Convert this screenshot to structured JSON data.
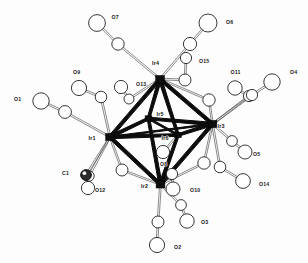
{
  "figure": {
    "kind": "ortep-crystal-structure",
    "background_color": "#fdfdfd",
    "line_color": "#1a1a1a",
    "metal_fill": "#0d0d0d",
    "carbonyl_fill": "#ffffff",
    "shaded_atom_fill": "#2b2b2b"
  },
  "metal_atoms": [
    {
      "label": "Ir1",
      "cx": 110.0,
      "cy": 137.0,
      "label_x": 88.5,
      "label_y": 140.0,
      "r": 4.4
    },
    {
      "label": "Ir2",
      "cx": 160.5,
      "cy": 184.5,
      "label_x": 141.0,
      "label_y": 187.5,
      "r": 4.4
    },
    {
      "label": "Ir3",
      "cx": 212.5,
      "cy": 124.0,
      "label_x": 217.5,
      "label_y": 127.5,
      "r": 4.4
    },
    {
      "label": "Ir4",
      "cx": 160.0,
      "cy": 79.0,
      "label_x": 152.0,
      "label_y": 64.5,
      "r": 4.4
    },
    {
      "label": "Ir5",
      "cx": 148.5,
      "cy": 118.5,
      "label_x": 156.5,
      "label_y": 116.0,
      "r": 3.4
    },
    {
      "label": "Ir6",
      "cx": 178.0,
      "cy": 135.0,
      "label_x": 161.5,
      "label_y": 140.0,
      "r": 3.4
    }
  ],
  "metal_metal_bonds": [
    {
      "from": "Ir4",
      "to": "Ir1",
      "weight": "heavy"
    },
    {
      "from": "Ir4",
      "to": "Ir3",
      "weight": "heavy"
    },
    {
      "from": "Ir4",
      "to": "Ir5",
      "weight": "heavy"
    },
    {
      "from": "Ir4",
      "to": "Ir6",
      "weight": "heavy"
    },
    {
      "from": "Ir1",
      "to": "Ir2",
      "weight": "heavy"
    },
    {
      "from": "Ir1",
      "to": "Ir5",
      "weight": "heavy"
    },
    {
      "from": "Ir1",
      "to": "Ir6",
      "weight": "heavy"
    },
    {
      "from": "Ir2",
      "to": "Ir3",
      "weight": "heavy"
    },
    {
      "from": "Ir2",
      "to": "Ir5",
      "weight": "heavy"
    },
    {
      "from": "Ir2",
      "to": "Ir6",
      "weight": "heavy"
    },
    {
      "from": "Ir3",
      "to": "Ir5",
      "weight": "heavy"
    },
    {
      "from": "Ir3",
      "to": "Ir6",
      "weight": "heavy"
    },
    {
      "from": "Ir5",
      "to": "Ir6",
      "weight": "medium"
    },
    {
      "from": "Ir1",
      "to": "Ir3",
      "weight": "thin"
    }
  ],
  "carbonyls": [
    {
      "label": "O1",
      "o_x": 41.0,
      "o_y": 101.0,
      "o_r": 8.2,
      "c_x": 65.0,
      "c_y": 112.0,
      "c_r": 6.4,
      "metal": "Ir1",
      "label_x": 14.0,
      "label_y": 100.5
    },
    {
      "label": "O9",
      "o_x": 79.0,
      "o_y": 88.0,
      "o_r": 7.6,
      "c_x": 101.0,
      "c_y": 97.0,
      "c_r": 5.8,
      "metal": "Ir1",
      "label_x": 73.0,
      "label_y": 73.5
    },
    {
      "label": "O12",
      "o_x": 88.0,
      "o_y": 188.0,
      "o_r": 6.6,
      "c_x": 89.0,
      "c_y": 176.0,
      "c_r": 5.2,
      "metal": "Ir1",
      "label_x": 95.0,
      "label_y": 192.0
    },
    {
      "label": "C1",
      "o_x": 86.0,
      "o_y": 175.0,
      "o_r": 5.4,
      "c_x": 86.0,
      "c_y": 175.0,
      "c_r": 5.4,
      "metal": "Ir1",
      "label_x": 62.0,
      "label_y": 174.5,
      "shaded": true
    },
    {
      "label": "O7",
      "o_x": 97.0,
      "o_y": 23.0,
      "o_r": 8.4,
      "c_x": 118.0,
      "c_y": 44.0,
      "c_r": 6.2,
      "metal": "Ir4",
      "label_x": 111.5,
      "label_y": 18.5
    },
    {
      "label": "O13",
      "o_x": 121.0,
      "o_y": 87.0,
      "o_r": 6.6,
      "c_x": 129.0,
      "c_y": 99.0,
      "c_r": 5.0,
      "metal": "Ir4",
      "label_x": 136.0,
      "label_y": 86.0
    },
    {
      "label": "O6",
      "o_x": 208.0,
      "o_y": 23.0,
      "o_r": 9.0,
      "c_x": 190.0,
      "c_y": 44.0,
      "c_r": 6.6,
      "metal": "Ir4",
      "label_x": 226.0,
      "label_y": 23.5
    },
    {
      "label": "O15",
      "o_x": 186.0,
      "o_y": 58.0,
      "o_r": 5.6,
      "c_x": 185.0,
      "c_y": 80.0,
      "c_r": 6.0,
      "metal": "Ir4",
      "label_x": 199.0,
      "label_y": 62.5
    },
    {
      "label": "O11",
      "o_x": 235.0,
      "o_y": 88.0,
      "o_r": 7.2,
      "c_x": 249.0,
      "c_y": 96.0,
      "c_r": 5.6,
      "metal": "Ir3",
      "label_x": 230.5,
      "label_y": 73.5
    },
    {
      "label": "O4",
      "o_x": 272.0,
      "o_y": 82.0,
      "o_r": 8.2,
      "c_x": 252.0,
      "c_y": 95.0,
      "c_r": 5.6,
      "metal": "Ir3",
      "label_x": 290.0,
      "label_y": 74.0
    },
    {
      "label": "O5",
      "o_x": 245.0,
      "o_y": 152.0,
      "o_r": 7.0,
      "c_x": 232.0,
      "c_y": 141.0,
      "c_r": 5.4,
      "metal": "Ir3",
      "label_x": 253.0,
      "label_y": 155.5
    },
    {
      "label": "O14",
      "o_x": 243.0,
      "o_y": 181.0,
      "o_r": 7.4,
      "c_x": 220.0,
      "c_y": 167.0,
      "c_r": 5.8,
      "metal": "Ir3",
      "label_x": 259.0,
      "label_y": 186.0
    },
    {
      "label": "O10",
      "o_x": 173.0,
      "o_y": 189.0,
      "o_r": 7.0,
      "c_x": 172.0,
      "c_y": 174.0,
      "c_r": 5.6,
      "metal": "Ir2",
      "label_x": 190.0,
      "label_y": 192.0
    },
    {
      "label": "O3",
      "o_x": 187.0,
      "o_y": 221.0,
      "o_r": 7.2,
      "c_x": 181.0,
      "c_y": 205.0,
      "c_r": 5.4,
      "metal": "Ir2",
      "label_x": 201.0,
      "label_y": 224.0
    },
    {
      "label": "O2",
      "o_x": 157.0,
      "o_y": 245.0,
      "o_r": 7.6,
      "c_x": 158.0,
      "c_y": 222.0,
      "c_r": 6.0,
      "metal": "Ir2",
      "label_x": 174.0,
      "label_y": 249.0
    },
    {
      "label": "O8",
      "o_x": 163.0,
      "o_y": 152.0,
      "o_r": 6.6,
      "c_x": 163.0,
      "c_y": 152.0,
      "c_r": 6.6,
      "metal": "Ir6",
      "label_x": 160.0,
      "label_y": 166.0
    }
  ],
  "other_vertices": [
    {
      "name": "bridge-c-left-lower",
      "x": 122.0,
      "y": 170.0,
      "r": 6.0
    },
    {
      "name": "bridge-c-right-lower",
      "x": 204.0,
      "y": 163.0,
      "r": 6.2
    },
    {
      "name": "bridge-c-right-upper",
      "x": 209.0,
      "y": 100.0,
      "r": 6.2
    }
  ],
  "labels_all": [
    "O1",
    "O2",
    "O3",
    "O4",
    "O5",
    "O6",
    "O7",
    "O8",
    "O9",
    "O10",
    "O11",
    "O12",
    "O13",
    "O14",
    "O15",
    "C1",
    "Ir1",
    "Ir2",
    "Ir3",
    "Ir4",
    "Ir5",
    "Ir6"
  ]
}
